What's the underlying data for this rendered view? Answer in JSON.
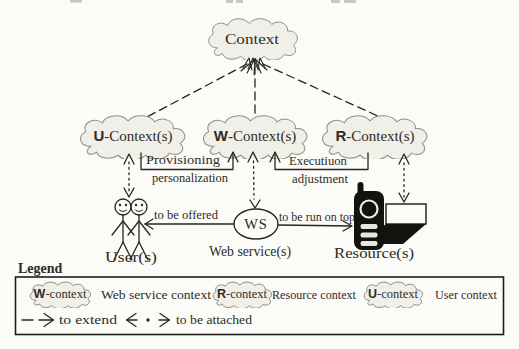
{
  "nodes": {
    "context": "Context",
    "u": {
      "b": "U",
      "rest": "-Context(s)"
    },
    "w": {
      "b": "W",
      "rest": "-Context(s)"
    },
    "r": {
      "b": "R",
      "rest": "-Context(s)"
    }
  },
  "edges": {
    "provisioning_line1": "Provisioning",
    "provisioning_line2": "personalization",
    "execution_line1": "Executiuon",
    "execution_line2": "adjustment",
    "offered": "to be offered",
    "run_on_top": "to be run on top"
  },
  "entities": {
    "ws": "WS",
    "users": "User(s)",
    "web_service": "Web service(s)",
    "resources": "Resource(s)"
  },
  "legend": {
    "title": "Legend",
    "w": {
      "b": "W",
      "rest": "-context"
    },
    "w_desc": "Web service context",
    "r": {
      "b": "R",
      "rest": "-context"
    },
    "r_desc": "Resource context",
    "u": {
      "b": "U",
      "rest": "-context"
    },
    "u_desc": "User context",
    "extend_desc": "to extend",
    "attached_desc": "to be attached"
  },
  "colors": {
    "background": "#fbfbf8",
    "cloud_fill": "#f0efe8",
    "cloud_stroke": "#8f8d84",
    "line": "#28251f",
    "text": "#2f2c26"
  }
}
